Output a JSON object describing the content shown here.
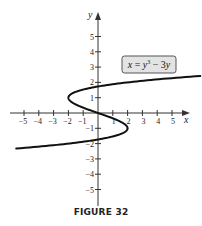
{
  "figure": {
    "caption": "FIGURE 32",
    "equation_label": "x = y³ − 3y",
    "x_axis_label": "x",
    "y_axis_label": "y",
    "colors": {
      "curve": "#111111",
      "axis": "#333333",
      "label_box_fill": "#e3e3e3",
      "label_box_stroke": "#555555"
    }
  },
  "chart_data": {
    "type": "line",
    "title": "",
    "caption": "FIGURE 32",
    "xlabel": "x",
    "ylabel": "y",
    "xlim": [
      -5.8,
      6.1
    ],
    "ylim": [
      -6,
      6
    ],
    "x_ticks": [
      -5,
      -4,
      -3,
      -2,
      -1,
      1,
      2,
      3,
      4,
      5
    ],
    "y_ticks": [
      -5,
      -4,
      -3,
      -2,
      -1,
      1,
      2,
      3,
      4,
      5
    ],
    "grid": false,
    "annotations": [
      {
        "text": "x = y³ − 3y",
        "position": "upper right, boxed"
      }
    ],
    "series": [
      {
        "name": "x = y^3 - 3y",
        "parametric": "x = y^3 - 3y",
        "y_range": [
          -2.32,
          2.42
        ],
        "points": [
          {
            "x": -5.8,
            "y": -2.32
          },
          {
            "x": -2.0,
            "y": -2.0
          },
          {
            "x": 0.0,
            "y": -1.73
          },
          {
            "x": 2.0,
            "y": -1.0
          },
          {
            "x": 0.0,
            "y": 0.0
          },
          {
            "x": -2.0,
            "y": 1.0
          },
          {
            "x": 0.0,
            "y": 1.73
          },
          {
            "x": 2.0,
            "y": 2.0
          },
          {
            "x": 6.1,
            "y": 2.42
          }
        ]
      }
    ]
  }
}
